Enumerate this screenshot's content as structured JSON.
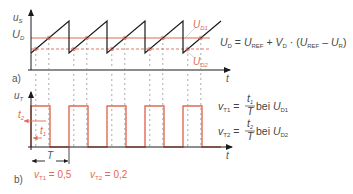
{
  "colors": {
    "axis": "#1a1a1a",
    "sawtooth": "#1a1a1a",
    "threshold": "#e06a55",
    "pulse": "#e06a55",
    "guide": "#888888",
    "text": "#444444"
  },
  "panel_a": {
    "label": "a)",
    "y_axis_label": "u",
    "y_axis_sub": "S",
    "level_label": "U",
    "level_sub": "D",
    "time_label": "t",
    "ud1_label": "U",
    "ud1_sub": "D1",
    "ud2_label": "U",
    "ud2_sub": "D2",
    "formula": {
      "lhs": "U",
      "lhs_sub": "D",
      "eq": " = ",
      "t1": "U",
      "t1_sub": "REF",
      "plus": " + ",
      "t2": "V",
      "t2_sub": "D",
      "dot": " · (",
      "t3": "U",
      "t3_sub": "REF",
      "minus": " – ",
      "t4": "U",
      "t4_sub": "R",
      "close": ")"
    }
  },
  "panel_b": {
    "label": "b)",
    "y_axis_label": "u",
    "y_axis_sub": "T",
    "time_label": "t",
    "t1_label": "t",
    "t1_sub": "1",
    "t2_label": "t",
    "t2_sub": "2",
    "period_label": "T",
    "duty1": {
      "sym": "v",
      "sub": "T1",
      "value": " = 0,5"
    },
    "duty2": {
      "sym": "v",
      "sub": "T2",
      "value": " = 0,2"
    },
    "formula1": {
      "lhs": "v",
      "lhs_sub": "T1",
      "eq": " = ",
      "num": "t",
      "num_sub": "1",
      "den": "T",
      "bei": " bei ",
      "u": "U",
      "u_sub": "D1"
    },
    "formula2": {
      "lhs": "v",
      "lhs_sub": "T2",
      "eq": " = ",
      "num": "t",
      "num_sub": "2",
      "den": "T",
      "bei": " bei ",
      "u": "U",
      "u_sub": "D2"
    }
  },
  "signal": {
    "periods_shown": 5,
    "duty_cycle_ud1": 0.5,
    "duty_cycle_ud2": 0.2
  }
}
